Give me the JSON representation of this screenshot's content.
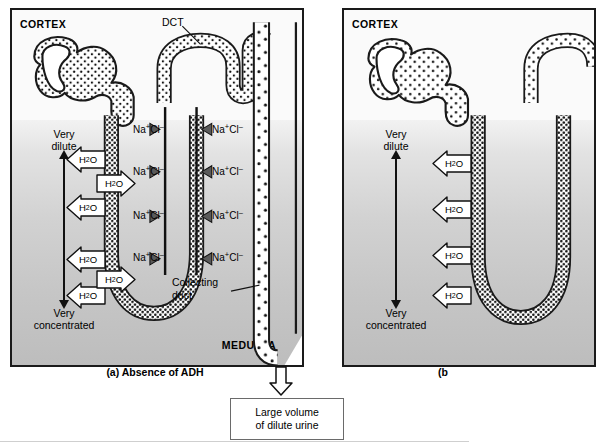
{
  "figure": {
    "panels": [
      {
        "id": "a",
        "caption": "(a) Absence of ADH",
        "cortex_label": "CORTEX",
        "medulla_label": "MEDULLA",
        "gradient": {
          "top_label": "Very\ndilute",
          "top_line1": "Very",
          "top_line2": "dilute",
          "bottom_line1": "Very",
          "bottom_line2": "concentrated"
        },
        "structures": [
          {
            "name": "DCT",
            "label": "DCT"
          },
          {
            "name": "collecting-duct",
            "label_line1": "Collecting",
            "label_line2": "duct"
          }
        ],
        "solute_labels": [
          "Na+Cl-",
          "Na+Cl-",
          "Na+Cl-",
          "Na+Cl-",
          "Na+Cl-",
          "Na+Cl-",
          "Na+Cl-",
          "Na+Cl-"
        ],
        "water_labels": [
          "H2O",
          "H2O",
          "H2O",
          "H2O",
          "H2O",
          "H2O"
        ]
      },
      {
        "id": "b",
        "caption": "(b",
        "cortex_label": "CORTEX",
        "gradient": {
          "top_line1": "Very",
          "top_line2": "dilute",
          "bottom_line1": "Very",
          "bottom_line2": "concentrated"
        },
        "water_labels": [
          "H2O",
          "H2O",
          "H2O",
          "H2O"
        ]
      }
    ],
    "output_box": {
      "line1": "Large volume",
      "line2": "of dilute urine"
    },
    "ion": {
      "sodium": "Na",
      "sodium_charge": "+",
      "chloride": "Cl",
      "chloride_charge": "–"
    },
    "water": {
      "formula_main": "H",
      "formula_sub": "2",
      "formula_tail": "O"
    },
    "colors": {
      "outline": "#1a1a1a",
      "cortex_bg": "#fafafa",
      "medulla_top": "#f2f2f2",
      "medulla_bottom": "#bdbdbd",
      "arrow_fill": "#ffffff",
      "ion_arrow": "#555555"
    }
  }
}
